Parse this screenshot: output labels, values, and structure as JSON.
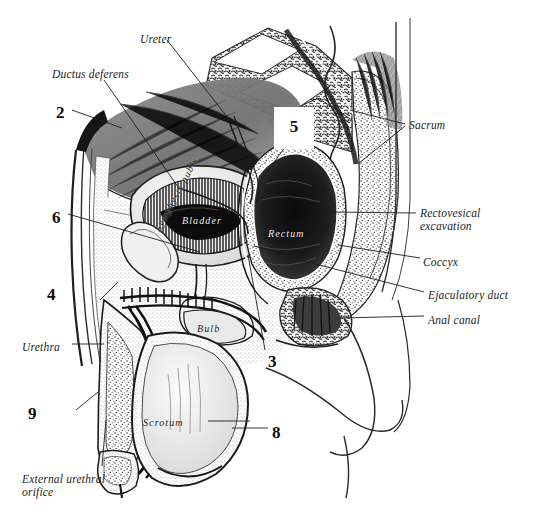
{
  "figure": {
    "kind": "anatomical-engraving",
    "style": "vintage monochrome line engraving / stipple halftone",
    "background_color": "#ffffff",
    "ink_color": "#1d1d1d"
  },
  "outer_labels": [
    {
      "id": "ureter",
      "text": "Ureter",
      "x": 140,
      "y": 33,
      "lines": 1
    },
    {
      "id": "ductus-deferens",
      "text": "Ductus deferens",
      "x": 52,
      "y": 68,
      "lines": 1
    },
    {
      "id": "sacrum",
      "text": "Sacrum",
      "x": 409,
      "y": 119,
      "lines": 1
    },
    {
      "id": "rectovesical",
      "text": "Rectovesical excavation",
      "x": 420,
      "y": 207,
      "lines": 2
    },
    {
      "id": "coccyx",
      "text": "Coccyx",
      "x": 423,
      "y": 256,
      "lines": 1
    },
    {
      "id": "ejaculatory-duct",
      "text": "Ejaculatory duct",
      "x": 428,
      "y": 289,
      "lines": 1
    },
    {
      "id": "anal-canal",
      "text": "Anal canal",
      "x": 428,
      "y": 314,
      "lines": 1
    },
    {
      "id": "urethra",
      "text": "Urethra",
      "x": 22,
      "y": 341,
      "lines": 1
    },
    {
      "id": "external-orifice",
      "text": "External urethral orifice",
      "x": 22,
      "y": 473,
      "lines": 2
    }
  ],
  "inner_labels": [
    {
      "id": "bladder",
      "text": "Bladder",
      "x": 182,
      "y": 215,
      "tone": "white",
      "rotated": false
    },
    {
      "id": "rectum",
      "text": "Rectum",
      "x": 268,
      "y": 228,
      "tone": "white",
      "rotated": false
    },
    {
      "id": "symphysis-pubis",
      "text": "Symphysis pubis",
      "x": 152,
      "y": 228,
      "tone": "dark",
      "rotated": true
    },
    {
      "id": "bulb",
      "text": "Bulb",
      "x": 197,
      "y": 323,
      "tone": "dark",
      "rotated": false
    },
    {
      "id": "scrotum",
      "text": "Scrotum",
      "x": 143,
      "y": 417,
      "tone": "dark",
      "rotated": false
    }
  ],
  "numbers": [
    {
      "id": "n2",
      "text": "2",
      "x": 56,
      "y": 103
    },
    {
      "id": "n5",
      "text": "5",
      "x": 288,
      "y": 117,
      "boxed": true
    },
    {
      "id": "n6",
      "text": "6",
      "x": 52,
      "y": 208
    },
    {
      "id": "n4",
      "text": "4",
      "x": 47,
      "y": 285
    },
    {
      "id": "n3",
      "text": "3",
      "x": 268,
      "y": 352
    },
    {
      "id": "n9",
      "text": "9",
      "x": 28,
      "y": 404
    },
    {
      "id": "n8",
      "text": "8",
      "x": 272,
      "y": 423
    }
  ],
  "leader_lines": [
    {
      "id": "leader-ureter",
      "from": [
        167,
        40
      ],
      "to": [
        228,
        118
      ]
    },
    {
      "id": "leader-ductus-deferens",
      "from": [
        104,
        80
      ],
      "to": [
        178,
        187
      ]
    },
    {
      "id": "leader-sacrum-a",
      "from": [
        405,
        124
      ],
      "to": [
        350,
        110
      ]
    },
    {
      "id": "leader-sacrum-b",
      "from": [
        405,
        126
      ],
      "to": [
        358,
        164
      ]
    },
    {
      "id": "leader-rectovesical",
      "from": [
        416,
        213
      ],
      "to": [
        330,
        212
      ]
    },
    {
      "id": "leader-coccyx",
      "from": [
        420,
        258
      ],
      "to": [
        338,
        245
      ]
    },
    {
      "id": "leader-ejaculatory",
      "from": [
        424,
        292
      ],
      "to": [
        300,
        260
      ]
    },
    {
      "id": "leader-anal-canal",
      "from": [
        424,
        316
      ],
      "to": [
        340,
        318
      ]
    },
    {
      "id": "leader-urethra",
      "from": [
        72,
        344
      ],
      "to": [
        104,
        344
      ]
    },
    {
      "id": "leader-orifice",
      "from": [
        102,
        466
      ],
      "to": [
        106,
        420
      ]
    },
    {
      "id": "leader-scrotum",
      "from": [
        208,
        421
      ],
      "to": [
        250,
        421
      ]
    },
    {
      "id": "leader-n2",
      "from": [
        72,
        110
      ],
      "to": [
        122,
        128
      ]
    },
    {
      "id": "leader-n6",
      "from": [
        68,
        214
      ],
      "to": [
        200,
        252
      ]
    },
    {
      "id": "leader-n4",
      "from": [
        100,
        300
      ],
      "to": [
        118,
        282
      ]
    },
    {
      "id": "leader-n3",
      "from": [
        265,
        350
      ],
      "to": [
        248,
        255
      ]
    },
    {
      "id": "leader-n8",
      "from": [
        268,
        428
      ],
      "to": [
        232,
        428
      ]
    },
    {
      "id": "leader-n9",
      "from": [
        76,
        410
      ],
      "to": [
        98,
        392
      ]
    },
    {
      "id": "leader-n5",
      "from": [
        290,
        140
      ],
      "to": [
        258,
        185
      ]
    }
  ]
}
